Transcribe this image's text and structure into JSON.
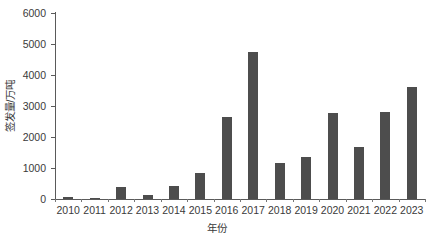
{
  "chart_data": {
    "type": "bar",
    "title": "",
    "subtitle": "",
    "xlabel": "年份",
    "ylabel": "签发量/万吨",
    "categories": [
      "2010",
      "2011",
      "2012",
      "2013",
      "2014",
      "2015",
      "2016",
      "2017",
      "2018",
      "2019",
      "2020",
      "2021",
      "2022",
      "2023"
    ],
    "values": [
      50,
      40,
      400,
      130,
      410,
      840,
      2650,
      4750,
      1160,
      1350,
      2790,
      1680,
      2810,
      3600
    ],
    "series": [
      {
        "name": "签发量",
        "values": [
          50,
          40,
          400,
          130,
          410,
          840,
          2650,
          4750,
          1160,
          1350,
          2790,
          1680,
          2810,
          3600
        ]
      }
    ],
    "ylim": [
      0,
      6000
    ],
    "yticks": [
      0,
      1000,
      2000,
      3000,
      4000,
      5000,
      6000
    ],
    "ytick_labels": [
      "0",
      "1000",
      "2000",
      "3000",
      "4000",
      "5000",
      "6000"
    ],
    "grid": false,
    "legend": false,
    "legend_position": "none",
    "bar_color": "#4d4d4d",
    "axis_color": "#5a5a5a",
    "text_color": "#3a3a3a",
    "background_color": "#ffffff"
  }
}
